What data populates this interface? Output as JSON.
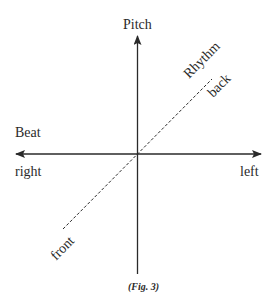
{
  "diagram": {
    "type": "axis-diagram",
    "axes": {
      "vertical": {
        "label": "Pitch"
      },
      "horizontal": {
        "label": "Beat",
        "negative_end": "right",
        "positive_end": "left"
      },
      "diagonal": {
        "label": "Rhythm",
        "far_end": "back",
        "near_end": "front",
        "style": "dashed"
      }
    },
    "caption": "(Fig. 3)",
    "colors": {
      "line": "#2a2a2a",
      "background": "#ffffff"
    }
  }
}
